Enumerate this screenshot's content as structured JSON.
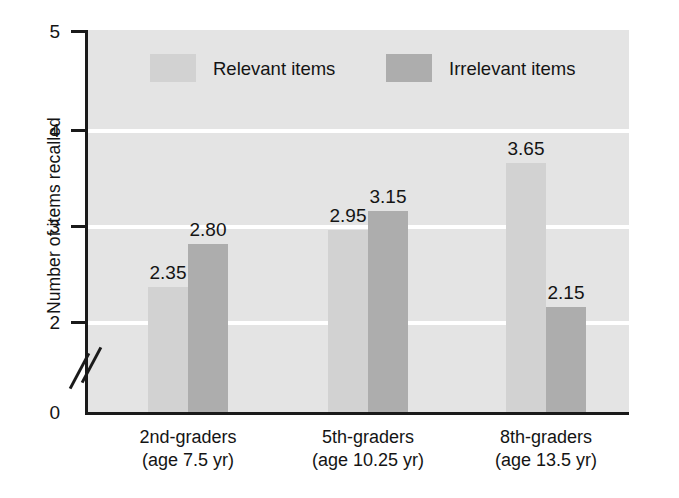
{
  "chart_data": {
    "type": "bar",
    "title": "",
    "xlabel": "",
    "ylabel": "Number of items recalled",
    "ylim": [
      0,
      5
    ],
    "yticks": [
      "0",
      "2",
      "3",
      "4",
      "5"
    ],
    "axis_break": true,
    "axis_break_between": [
      "0",
      "2"
    ],
    "grid": true,
    "gridlines_at": [
      2,
      3,
      4
    ],
    "legend_position": "top-inside",
    "categories": [
      "2nd-graders (age 7.5 yr)",
      "5th-graders (age 10.25 yr)",
      "8th-graders (age 13.5 yr)"
    ],
    "category_lines": [
      {
        "line1": "2nd-graders",
        "line2": "(age 7.5 yr)"
      },
      {
        "line1": "5th-graders",
        "line2": "(age 10.25 yr)"
      },
      {
        "line1": "8th-graders",
        "line2": "(age 13.5 yr)"
      }
    ],
    "series": [
      {
        "name": "Relevant items",
        "color": "#d2d2d2",
        "values": [
          2.35,
          2.95,
          3.65
        ],
        "labels": [
          "2.35",
          "2.95",
          "3.65"
        ]
      },
      {
        "name": "Irrelevant items",
        "color": "#adadad",
        "values": [
          2.8,
          3.15,
          2.15
        ],
        "labels": [
          "2.80",
          "3.15",
          "2.15"
        ]
      }
    ]
  },
  "axis": {
    "y_title": "Number of items recalled",
    "y_tick_5": "5",
    "y_tick_4": "4",
    "y_tick_3": "3",
    "y_tick_2": "2",
    "y_tick_0": "0"
  },
  "legend": {
    "relevant_label": "Relevant items",
    "irrelevant_label": "Irrelevant items"
  },
  "bars": {
    "g1_relevant_value": "2.35",
    "g1_irrelevant_value": "2.80",
    "g2_relevant_value": "2.95",
    "g2_irrelevant_value": "3.15",
    "g3_relevant_value": "3.65",
    "g3_irrelevant_value": "2.15"
  },
  "categories": {
    "c1_line1": "2nd-graders",
    "c1_line2": "(age 7.5 yr)",
    "c2_line1": "5th-graders",
    "c2_line2": "(age 10.25 yr)",
    "c3_line1": "8th-graders",
    "c3_line2": "(age 13.5 yr)"
  },
  "colors": {
    "plot_background": "#e4e4e4",
    "gridline": "#ffffff",
    "relevant_bar": "#d2d2d2",
    "irrelevant_bar": "#adadad",
    "axis": "#1a1a1a"
  }
}
